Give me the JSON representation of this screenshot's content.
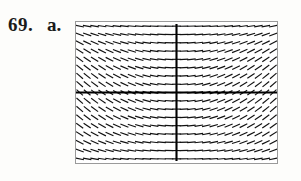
{
  "figure": {
    "exercise_number": "69.",
    "part_letter": "a.",
    "caption_text": "69. a."
  },
  "colors": {
    "page_background": "#fdfdfb",
    "plot_background": "#ffffff",
    "frame_border": "#9a9a9a",
    "segment_stroke": "#111111",
    "axis_stroke": "#000000",
    "label_text": "#1a1a1a"
  },
  "plot": {
    "type": "slope-field",
    "frame": {
      "x": 75,
      "y": 21,
      "width": 203,
      "height": 143
    },
    "axes": {
      "vertical_axis_x": 101,
      "horizontal_axis_y": 69,
      "show_vertical": true,
      "show_horizontal": true
    },
    "grid": {
      "columns": 27,
      "rows": 17
    },
    "domain": {
      "xmin": -4,
      "xmax": 4,
      "ymin": -3,
      "ymax": 3
    }
  },
  "chart_data": {
    "type": "scatter",
    "title": "",
    "xlabel": "",
    "ylabel": "",
    "xlim": [
      -4,
      4
    ],
    "ylim": [
      -3,
      3
    ],
    "grid": false,
    "legend_position": "none",
    "slope_rule": "slope = -x * y_env, steepening away from the vertical axis and flattening near the top and bottom edges",
    "x": [
      -4,
      -3.5,
      -3,
      -2.5,
      -2,
      -1.5,
      -1,
      -0.5,
      0,
      0.5,
      1,
      1.5,
      2,
      2.5,
      3,
      3.5,
      4
    ],
    "y": [
      -3,
      -2.625,
      -2.25,
      -1.875,
      -1.5,
      -1.125,
      -0.75,
      -0.375,
      0,
      0.375,
      0.75,
      1.125,
      1.5,
      1.875,
      2.25,
      2.625,
      3
    ],
    "series": [
      {
        "name": "segment-slope-at-y=3",
        "values": [
          -0.12,
          -0.1,
          -0.09,
          -0.07,
          -0.06,
          -0.04,
          -0.03,
          -0.01,
          0,
          0.01,
          0.03,
          0.04,
          0.06,
          0.07,
          0.09,
          0.1,
          0.12
        ]
      },
      {
        "name": "segment-slope-at-y=2.25",
        "values": [
          -0.34,
          -0.3,
          -0.26,
          -0.21,
          -0.17,
          -0.13,
          -0.08,
          -0.04,
          0,
          0.04,
          0.08,
          0.13,
          0.17,
          0.21,
          0.26,
          0.3,
          0.34
        ]
      },
      {
        "name": "segment-slope-at-y=1.5",
        "values": [
          -0.7,
          -0.61,
          -0.52,
          -0.44,
          -0.35,
          -0.26,
          -0.17,
          -0.09,
          0,
          0.09,
          0.17,
          0.26,
          0.35,
          0.44,
          0.52,
          0.61,
          0.7
        ]
      },
      {
        "name": "segment-slope-at-y=0.75",
        "values": [
          -1.05,
          -0.92,
          -0.79,
          -0.66,
          -0.53,
          -0.39,
          -0.26,
          -0.13,
          0,
          0.13,
          0.26,
          0.39,
          0.53,
          0.66,
          0.79,
          0.92,
          1.05
        ]
      },
      {
        "name": "segment-slope-at-y=0",
        "values": [
          -1.25,
          -1.09,
          -0.94,
          -0.78,
          -0.63,
          -0.47,
          -0.31,
          -0.16,
          0,
          0.16,
          0.31,
          0.47,
          0.63,
          0.78,
          0.94,
          1.09,
          1.25
        ]
      },
      {
        "name": "segment-slope-at-y=-0.75",
        "values": [
          -1.05,
          -0.92,
          -0.79,
          -0.66,
          -0.53,
          -0.39,
          -0.26,
          -0.13,
          0,
          0.13,
          0.26,
          0.39,
          0.53,
          0.66,
          0.79,
          0.92,
          1.05
        ]
      },
      {
        "name": "segment-slope-at-y=-1.5",
        "values": [
          -0.7,
          -0.61,
          -0.52,
          -0.44,
          -0.35,
          -0.26,
          -0.17,
          -0.09,
          0,
          0.09,
          0.17,
          0.26,
          0.35,
          0.44,
          0.52,
          0.61,
          0.7
        ]
      },
      {
        "name": "segment-slope-at-y=-2.25",
        "values": [
          -0.34,
          -0.3,
          -0.26,
          -0.21,
          -0.17,
          -0.13,
          -0.08,
          -0.04,
          0,
          0.04,
          0.08,
          0.13,
          0.17,
          0.21,
          0.26,
          0.3,
          0.34
        ]
      },
      {
        "name": "segment-slope-at-y=-3",
        "values": [
          -0.12,
          -0.1,
          -0.09,
          -0.07,
          -0.06,
          -0.04,
          -0.03,
          -0.01,
          0,
          0.01,
          0.03,
          0.04,
          0.06,
          0.07,
          0.09,
          0.1,
          0.12
        ]
      }
    ]
  }
}
